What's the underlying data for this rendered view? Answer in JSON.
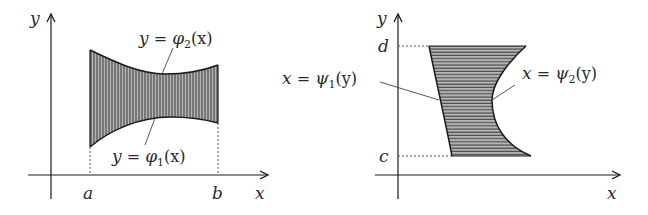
{
  "figure": {
    "left_panel": {
      "axis_x_label": "x",
      "axis_y_label": "y",
      "tick_a": "a",
      "tick_b": "b",
      "upper_curve_label": {
        "lhs": "y",
        "eq": " = ",
        "func": "φ",
        "sub": "2",
        "arg": "(x)"
      },
      "lower_curve_label": {
        "lhs": "y",
        "eq": " = ",
        "func": "φ",
        "sub": "1",
        "arg": "(x)"
      },
      "shading": "vertical-lines"
    },
    "right_panel": {
      "axis_x_label": "x",
      "axis_y_label": "y",
      "tick_c": "c",
      "tick_d": "d",
      "left_curve_label": {
        "lhs": "x",
        "eq": " = ",
        "func": "ψ",
        "sub": "1",
        "arg": "(y)"
      },
      "right_curve_label": {
        "lhs": "x",
        "eq": " = ",
        "func": "ψ",
        "sub": "2",
        "arg": "(y)"
      },
      "shading": "horizontal-lines"
    },
    "colors": {
      "fill": "#9a9a9a",
      "hatch": "#3a3a3a",
      "stroke": "#1a1a1a",
      "text": "#2a2a2a"
    }
  }
}
